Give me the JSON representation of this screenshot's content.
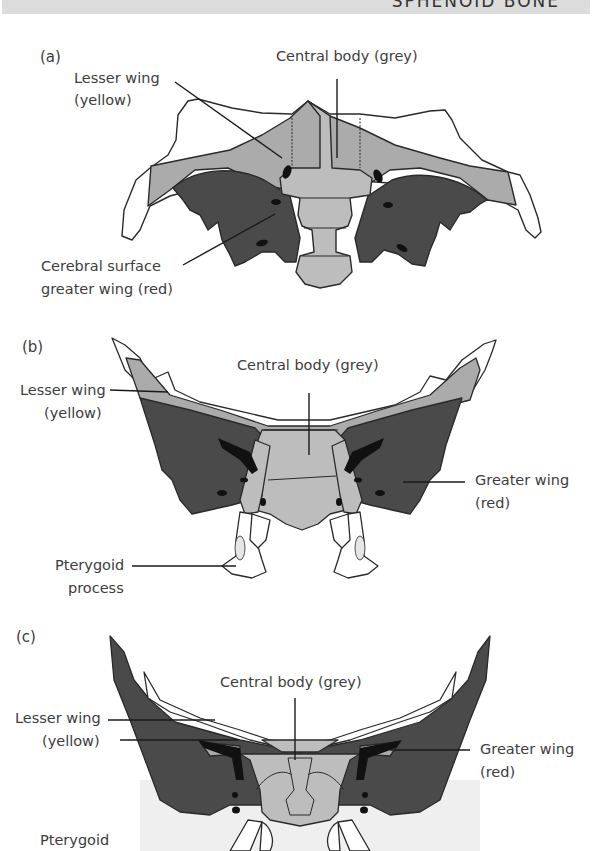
{
  "header": {
    "title": "SPHENOID BONE"
  },
  "colors": {
    "central_body_grey": "#bdbdbd",
    "lesser_wing": "#ababab",
    "greater_wing_red": "#4a4a4a",
    "foramen": "#111111",
    "outline": "#2a2a2a",
    "header_bar": "#dcdcdc"
  },
  "panels": [
    {
      "letter": "(a)",
      "labels": {
        "central_body": "Central body (grey)",
        "lesser_wing_1": "Lesser wing",
        "lesser_wing_2": "(yellow)",
        "cerebral_1": "Cerebral surface",
        "cerebral_2": "greater wing (red)"
      }
    },
    {
      "letter": "(b)",
      "labels": {
        "central_body": "Central body (grey)",
        "lesser_wing_1": "Lesser wing",
        "lesser_wing_2": "(yellow)",
        "greater_wing_1": "Greater wing",
        "greater_wing_2": "(red)",
        "pterygoid_1": "Pterygoid",
        "pterygoid_2": "process"
      }
    },
    {
      "letter": "(c)",
      "labels": {
        "central_body": "Central body (grey)",
        "lesser_wing_1": "Lesser wing",
        "lesser_wing_2": "(yellow)",
        "greater_wing_1": "Greater wing",
        "greater_wing_2": "(red)",
        "pterygoid_1": "Pterygoid"
      }
    }
  ]
}
